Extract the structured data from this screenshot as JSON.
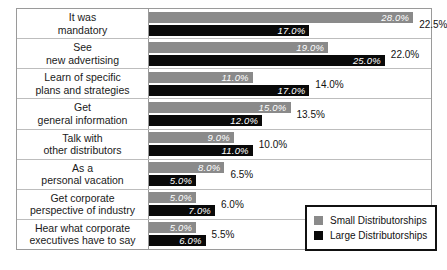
{
  "chart_data": {
    "type": "bar",
    "orientation": "horizontal",
    "title": "",
    "xlabel": "",
    "ylabel": "",
    "grid": false,
    "legend_position": "bottom-right",
    "xlim": [
      0,
      30
    ],
    "value_suffix": "%",
    "categories": [
      "It was mandatory",
      "See new advertising",
      "Learn of specific plans and strategies",
      "Get general information",
      "Talk with other distributors",
      "As a personal vacation",
      "Get corporate perspective of industry",
      "Hear what corporate executives have to say"
    ],
    "category_lines": [
      [
        "It was",
        "mandatory"
      ],
      [
        "See",
        "new advertising"
      ],
      [
        "Learn of specific",
        "plans and strategies"
      ],
      [
        "Get",
        "general information"
      ],
      [
        "Talk with",
        "other distributors"
      ],
      [
        "As a",
        "personal vacation"
      ],
      [
        "Get corporate",
        "perspective of industry"
      ],
      [
        "Hear what corporate",
        "executives have to say"
      ]
    ],
    "series": [
      {
        "name": "Small Distributorships",
        "color": "#8a8a8a",
        "values": [
          28.0,
          19.0,
          11.0,
          15.0,
          9.0,
          8.0,
          5.0,
          5.0
        ],
        "labels": [
          "28.0%",
          "19.0%",
          "11.0%",
          "15.0%",
          "9.0%",
          "8.0%",
          "5.0%",
          "5.0%"
        ]
      },
      {
        "name": "Large Distributorships",
        "color": "#090909",
        "values": [
          17.0,
          25.0,
          17.0,
          12.0,
          11.0,
          5.0,
          7.0,
          6.0
        ],
        "labels": [
          "17.0%",
          "25.0%",
          "17.0%",
          "12.0%",
          "11.0%",
          "5.0%",
          "7.0%",
          "6.0%"
        ]
      }
    ],
    "combined_values": [
      22.5,
      22.0,
      14.0,
      13.5,
      10.0,
      6.5,
      6.0,
      5.5
    ],
    "combined_labels": [
      "22.5%",
      "22.0%",
      "14.0%",
      "13.5%",
      "10.0%",
      "6.5%",
      "6.0%",
      "5.5%"
    ]
  },
  "legend": {
    "items": [
      {
        "label": "Small Distributorships",
        "color": "#8a8a8a"
      },
      {
        "label": "Large Distributorships",
        "color": "#090909"
      }
    ]
  }
}
